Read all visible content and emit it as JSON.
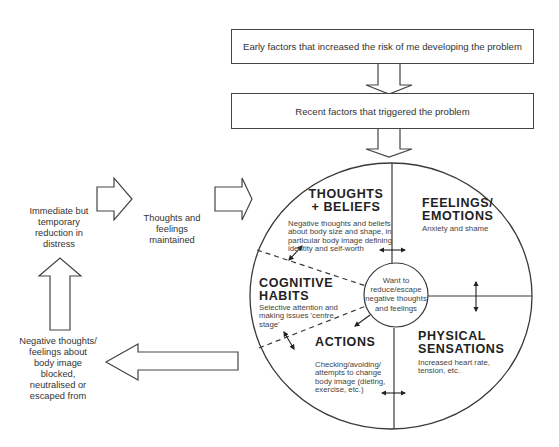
{
  "top_boxes": {
    "early_factors": "Early factors that increased the risk of me developing the problem",
    "recent_factors": "Recent factors that triggered the problem"
  },
  "left_flow": {
    "immediate_relief": [
      "Immediate but",
      "temporary",
      "reduction in",
      "distress"
    ],
    "maintained": [
      "Thoughts and",
      "feelings",
      "maintained"
    ],
    "blocked": [
      "Negative thoughts/",
      "feelings about",
      "body image",
      "blocked,",
      "neutralised or",
      "escaped from"
    ]
  },
  "circle": {
    "thoughts": {
      "heading": [
        "THOUGHTS",
        "+ BELIEFS"
      ],
      "body": [
        "Negative thoughts and beliefs",
        "about body size and shape, in",
        "particular body image defining",
        "identity and self-worth"
      ]
    },
    "feelings": {
      "heading": [
        "FEELINGS/",
        "EMOTIONS"
      ],
      "body": [
        "Anxiety and shame"
      ]
    },
    "cognitive": {
      "heading": [
        "COGNITIVE",
        "HABITS"
      ],
      "body": [
        "Selective attention and",
        "making issues 'centre",
        "stage'"
      ]
    },
    "actions": {
      "heading": [
        "ACTIONS"
      ],
      "body": [
        "Checking/avoiding/",
        "attempts to change",
        "body image (dieting,",
        "exercise, etc.)"
      ]
    },
    "physical": {
      "heading": [
        "PHYSICAL",
        "SENSATIONS"
      ],
      "body": [
        "Increased heart rate,",
        "tension, etc."
      ]
    },
    "center": [
      "Want to",
      "reduce/escape",
      "negative thoughts",
      "and feelings"
    ]
  },
  "colors": {
    "line": "#3a3a3a",
    "text": "#333333",
    "background": "#ffffff"
  }
}
